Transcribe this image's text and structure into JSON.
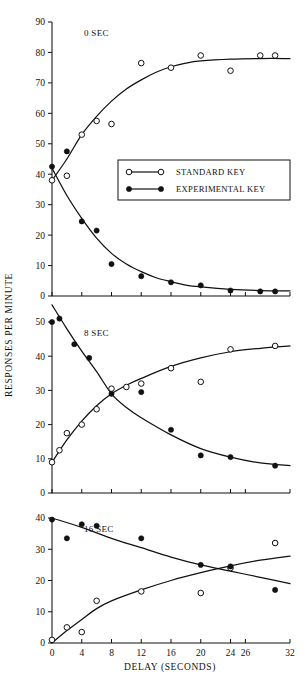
{
  "figure": {
    "y_axis_title": "RESPONSES PER MINUTE",
    "x_axis_title": "DELAY (SECONDS)"
  },
  "legend": {
    "position": "inside-top-panel",
    "entries": [
      {
        "label": "STANDARD KEY",
        "marker": "open-circle"
      },
      {
        "label": "EXPERIMENTAL KEY",
        "marker": "filled-circle"
      }
    ]
  },
  "chart_data": [
    {
      "type": "scatter",
      "title": "0 SEC",
      "panel_label": "0 SEC",
      "xlabel": "DELAY (SECONDS)",
      "ylabel": "RESPONSES PER MINUTE",
      "xlim": [
        0,
        32
      ],
      "ylim": [
        0,
        90
      ],
      "xticks": [
        0,
        4,
        8,
        12,
        16,
        20,
        24,
        26,
        32
      ],
      "xtick_labels": [
        "0",
        "4",
        "8",
        "12",
        "16",
        "20",
        "24",
        "26",
        "32"
      ],
      "yticks": [
        0,
        10,
        20,
        30,
        40,
        50,
        60,
        70,
        80,
        90
      ],
      "ytick_labels": [
        "0",
        "10",
        "20",
        "30",
        "40",
        "50",
        "60",
        "70",
        "80",
        "90"
      ],
      "grid": false,
      "series": [
        {
          "name": "STANDARD KEY",
          "marker": "open-circle",
          "x": [
            0,
            2,
            4,
            6,
            8,
            12,
            16,
            20,
            24,
            28,
            30
          ],
          "y": [
            38,
            39.5,
            53,
            57.5,
            56.5,
            76.5,
            75,
            79,
            74,
            79,
            79
          ]
        },
        {
          "name": "EXPERIMENTAL KEY",
          "marker": "filled-circle",
          "x": [
            0,
            2,
            4,
            6,
            8,
            12,
            16,
            20,
            24,
            28,
            30
          ],
          "y": [
            42.5,
            47.5,
            24.5,
            21.5,
            10.5,
            6.5,
            4.5,
            3.5,
            1.8,
            1.5,
            1.5
          ]
        }
      ],
      "fit_curves": [
        {
          "name": "STANDARD KEY",
          "points": [
            [
              0,
              38
            ],
            [
              2,
              45
            ],
            [
              4,
              53
            ],
            [
              6,
              59
            ],
            [
              8,
              64
            ],
            [
              10,
              68
            ],
            [
              12,
              71
            ],
            [
              14,
              73.5
            ],
            [
              16,
              75.3
            ],
            [
              18,
              76.5
            ],
            [
              20,
              77.2
            ],
            [
              24,
              77.8
            ],
            [
              28,
              78
            ],
            [
              32,
              78
            ]
          ]
        },
        {
          "name": "EXPERIMENTAL KEY",
          "points": [
            [
              0,
              42
            ],
            [
              2,
              33
            ],
            [
              4,
              25.5
            ],
            [
              6,
              19
            ],
            [
              8,
              14
            ],
            [
              10,
              10.5
            ],
            [
              12,
              8
            ],
            [
              14,
              6
            ],
            [
              16,
              4.7
            ],
            [
              18,
              3.6
            ],
            [
              20,
              3
            ],
            [
              24,
              2.2
            ],
            [
              28,
              1.8
            ],
            [
              32,
              1.7
            ]
          ]
        }
      ]
    },
    {
      "type": "scatter",
      "title": "8 SEC",
      "panel_label": "8 SEC",
      "xlabel": "DELAY (SECONDS)",
      "ylabel": "RESPONSES PER MINUTE",
      "xlim": [
        0,
        32
      ],
      "ylim": [
        0,
        50
      ],
      "xticks": [
        0,
        4,
        8,
        12,
        16,
        20,
        24,
        26,
        32
      ],
      "xtick_labels": [
        "0",
        "4",
        "8",
        "12",
        "16",
        "20",
        "24",
        "26",
        "32"
      ],
      "yticks": [
        0,
        10,
        20,
        30,
        40,
        50
      ],
      "ytick_labels": [
        "0",
        "10",
        "20",
        "30",
        "40",
        "50"
      ],
      "grid": false,
      "series": [
        {
          "name": "STANDARD KEY",
          "marker": "open-circle",
          "x": [
            0,
            1,
            2,
            4,
            6,
            8,
            10,
            12,
            16,
            20,
            24,
            30
          ],
          "y": [
            9,
            12.5,
            17.5,
            20,
            24.5,
            30.5,
            31,
            32,
            36.5,
            32.5,
            42,
            43
          ]
        },
        {
          "name": "EXPERIMENTAL KEY",
          "marker": "filled-circle",
          "x": [
            0,
            1,
            3,
            5,
            8,
            12,
            16,
            20,
            24,
            30
          ],
          "y": [
            50,
            51,
            43.5,
            39.5,
            29,
            29.5,
            18.5,
            11,
            10.5,
            8
          ]
        }
      ],
      "fit_curves": [
        {
          "name": "STANDARD KEY",
          "points": [
            [
              0,
              9
            ],
            [
              2,
              15.5
            ],
            [
              4,
              21
            ],
            [
              6,
              25.5
            ],
            [
              8,
              29
            ],
            [
              10,
              31.5
            ],
            [
              12,
              33.5
            ],
            [
              16,
              37
            ],
            [
              20,
              39.5
            ],
            [
              24,
              41.3
            ],
            [
              28,
              42.3
            ],
            [
              32,
              43
            ]
          ]
        },
        {
          "name": "EXPERIMENTAL KEY",
          "points": [
            [
              0,
              55
            ],
            [
              2,
              48
            ],
            [
              4,
              41.5
            ],
            [
              6,
              35.5
            ],
            [
              8,
              29
            ],
            [
              10,
              25
            ],
            [
              12,
              22
            ],
            [
              16,
              17
            ],
            [
              20,
              13
            ],
            [
              24,
              10.5
            ],
            [
              28,
              8.8
            ],
            [
              32,
              8
            ]
          ]
        }
      ]
    },
    {
      "type": "scatter",
      "title": "16 SEC",
      "panel_label": "16 SEC",
      "xlabel": "DELAY (SECONDS)",
      "ylabel": "RESPONSES PER MINUTE",
      "xlim": [
        0,
        32
      ],
      "ylim": [
        0,
        40
      ],
      "xticks": [
        0,
        4,
        8,
        12,
        16,
        20,
        24,
        26,
        32
      ],
      "xtick_labels": [
        "0",
        "4",
        "8",
        "12",
        "16",
        "20",
        "24",
        "26",
        "32"
      ],
      "yticks": [
        0,
        10,
        20,
        30,
        40
      ],
      "ytick_labels": [
        "0",
        "10",
        "20",
        "30",
        "40"
      ],
      "grid": false,
      "series": [
        {
          "name": "STANDARD KEY",
          "marker": "open-circle",
          "x": [
            0,
            2,
            4,
            6,
            12,
            20,
            24,
            30
          ],
          "y": [
            1,
            5,
            3.5,
            13.5,
            16.5,
            16,
            24,
            32
          ]
        },
        {
          "name": "EXPERIMENTAL KEY",
          "marker": "filled-circle",
          "x": [
            0,
            2,
            4,
            6,
            12,
            20,
            24,
            30
          ],
          "y": [
            39.5,
            33.5,
            38,
            37.5,
            33.5,
            25,
            24.5,
            17
          ]
        }
      ],
      "fit_curves": [
        {
          "name": "STANDARD KEY",
          "points": [
            [
              0,
              0
            ],
            [
              2,
              4
            ],
            [
              4,
              7.5
            ],
            [
              6,
              11
            ],
            [
              8,
              13.5
            ],
            [
              12,
              17
            ],
            [
              16,
              20
            ],
            [
              20,
              22.5
            ],
            [
              24,
              24.7
            ],
            [
              28,
              26.5
            ],
            [
              32,
              27.8
            ]
          ]
        },
        {
          "name": "EXPERIMENTAL KEY",
          "points": [
            [
              0,
              40
            ],
            [
              4,
              37
            ],
            [
              8,
              33.5
            ],
            [
              12,
              30.5
            ],
            [
              16,
              27.5
            ],
            [
              20,
              25
            ],
            [
              24,
              23
            ],
            [
              28,
              21
            ],
            [
              32,
              19
            ]
          ]
        }
      ]
    }
  ]
}
